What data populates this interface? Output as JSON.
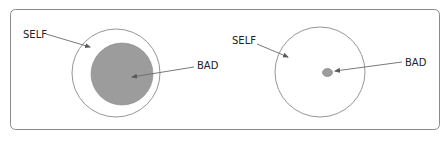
{
  "diagram": {
    "colors": {
      "frame": "#8a8a8a",
      "circle_stroke": "#8a8a8a",
      "bad_fill": "#9c9c9c",
      "bad_stroke": "#7a7a7a",
      "arrow": "#6a6a6a",
      "text": "#222222"
    },
    "left_panel": {
      "self_label": "SELF",
      "bad_label": "BAD",
      "description": "Large BAD region inside SELF"
    },
    "right_panel": {
      "self_label": "SELF",
      "bad_label": "BAD",
      "description": "Small BAD region inside SELF"
    }
  }
}
